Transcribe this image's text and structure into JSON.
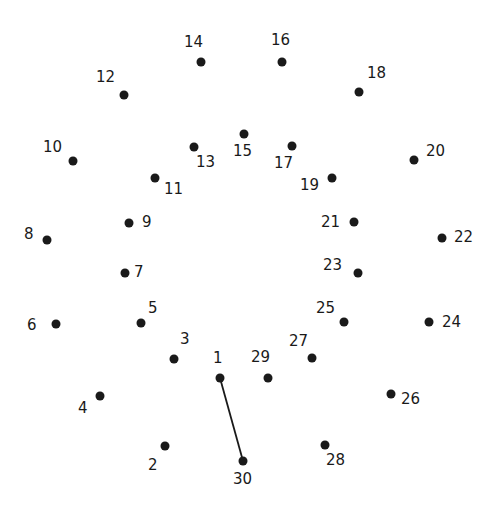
{
  "puzzle": {
    "type": "connect-the-dots",
    "dot_color": "#1a1a1a",
    "line_color": "#1a1a1a",
    "background": "#ffffff",
    "dots": [
      {
        "n": "1",
        "x": 220,
        "y": 378,
        "lx": 213,
        "ly": 363
      },
      {
        "n": "2",
        "x": 165,
        "y": 446,
        "lx": 148,
        "ly": 470
      },
      {
        "n": "3",
        "x": 174,
        "y": 359,
        "lx": 180,
        "ly": 344
      },
      {
        "n": "4",
        "x": 100,
        "y": 396,
        "lx": 78,
        "ly": 413
      },
      {
        "n": "5",
        "x": 141,
        "y": 323,
        "lx": 148,
        "ly": 313
      },
      {
        "n": "6",
        "x": 56,
        "y": 324,
        "lx": 27,
        "ly": 330
      },
      {
        "n": "7",
        "x": 125,
        "y": 273,
        "lx": 134,
        "ly": 277
      },
      {
        "n": "8",
        "x": 47,
        "y": 240,
        "lx": 24,
        "ly": 239
      },
      {
        "n": "9",
        "x": 129,
        "y": 223,
        "lx": 142,
        "ly": 227
      },
      {
        "n": "10",
        "x": 73,
        "y": 161,
        "lx": 43,
        "ly": 152
      },
      {
        "n": "11",
        "x": 155,
        "y": 178,
        "lx": 164,
        "ly": 194
      },
      {
        "n": "12",
        "x": 124,
        "y": 95,
        "lx": 96,
        "ly": 82
      },
      {
        "n": "13",
        "x": 194,
        "y": 147,
        "lx": 196,
        "ly": 167
      },
      {
        "n": "14",
        "x": 201,
        "y": 62,
        "lx": 184,
        "ly": 47
      },
      {
        "n": "15",
        "x": 244,
        "y": 134,
        "lx": 233,
        "ly": 156
      },
      {
        "n": "16",
        "x": 282,
        "y": 62,
        "lx": 271,
        "ly": 45
      },
      {
        "n": "17",
        "x": 292,
        "y": 146,
        "lx": 274,
        "ly": 168
      },
      {
        "n": "18",
        "x": 359,
        "y": 92,
        "lx": 367,
        "ly": 78
      },
      {
        "n": "19",
        "x": 332,
        "y": 178,
        "lx": 300,
        "ly": 190
      },
      {
        "n": "20",
        "x": 414,
        "y": 160,
        "lx": 426,
        "ly": 156
      },
      {
        "n": "21",
        "x": 354,
        "y": 222,
        "lx": 321,
        "ly": 227
      },
      {
        "n": "22",
        "x": 442,
        "y": 238,
        "lx": 454,
        "ly": 242
      },
      {
        "n": "23",
        "x": 358,
        "y": 273,
        "lx": 323,
        "ly": 270
      },
      {
        "n": "24",
        "x": 429,
        "y": 322,
        "lx": 442,
        "ly": 327
      },
      {
        "n": "25",
        "x": 344,
        "y": 322,
        "lx": 316,
        "ly": 313
      },
      {
        "n": "26",
        "x": 391,
        "y": 394,
        "lx": 401,
        "ly": 404
      },
      {
        "n": "27",
        "x": 312,
        "y": 358,
        "lx": 289,
        "ly": 346
      },
      {
        "n": "28",
        "x": 325,
        "y": 445,
        "lx": 326,
        "ly": 465
      },
      {
        "n": "29",
        "x": 268,
        "y": 378,
        "lx": 251,
        "ly": 362
      },
      {
        "n": "30",
        "x": 243,
        "y": 461,
        "lx": 233,
        "ly": 484
      }
    ],
    "connected_segments": [
      {
        "from": "1",
        "to": "30"
      }
    ]
  }
}
